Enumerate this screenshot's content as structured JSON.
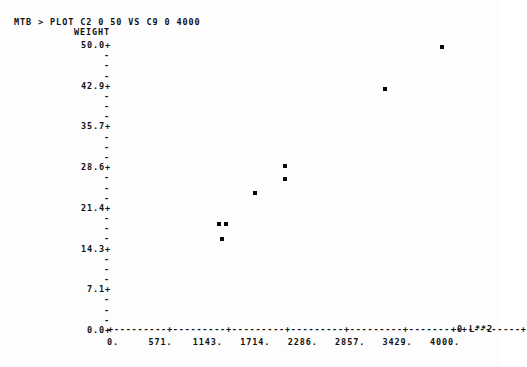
{
  "terminal": {
    "prompt_line": "MTB > PLOT C2 0 50 VS C9 0 4000"
  },
  "axis_titles": {
    "y": "WEIGHT",
    "x_unit": "L**2",
    "x_exponent_marker": "+0"
  },
  "y_axis": {
    "ticks": [
      "50.0+",
      "42.9+",
      "35.7+",
      "28.6+",
      "21.4+",
      "14.3+",
      "7.1+",
      "0.0+"
    ],
    "minor_tick_glyph": "-",
    "minor_ticks_between": 3
  },
  "x_axis": {
    "line": "+---------+---------+---------+---------+---------+---------+---------+",
    "labels": [
      "0.",
      "571.",
      "1143.",
      "1714.",
      "2286.",
      "2857.",
      "3429.",
      "4000."
    ]
  },
  "chart_data": {
    "type": "scatter",
    "title": "MTB > PLOT C2 0 50 VS C9 0 4000",
    "xlabel": "L**2",
    "ylabel": "WEIGHT",
    "xlim": [
      0,
      4000
    ],
    "ylim": [
      0,
      50
    ],
    "xticks": [
      0,
      571,
      1143,
      1714,
      2286,
      2857,
      3429,
      4000
    ],
    "yticks": [
      0.0,
      7.1,
      14.3,
      21.4,
      28.6,
      35.7,
      42.9,
      50.0
    ],
    "grid": false,
    "legend": false,
    "marker": "*",
    "points": [
      {
        "x": 1277,
        "y": 18.6
      },
      {
        "x": 1362,
        "y": 18.6
      },
      {
        "x": 1313,
        "y": 16.0
      },
      {
        "x": 1711,
        "y": 24.0
      },
      {
        "x": 2073,
        "y": 28.8
      },
      {
        "x": 2073,
        "y": 26.5
      },
      {
        "x": 3277,
        "y": 42.3
      },
      {
        "x": 3964,
        "y": 49.6
      }
    ]
  }
}
